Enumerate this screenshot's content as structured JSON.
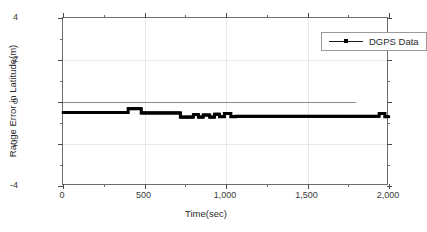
{
  "chart_data": {
    "type": "line",
    "title": "",
    "xlabel": "Time(sec)",
    "ylabel": "Range Error in Latitude(m)",
    "xlim": [
      0,
      2000
    ],
    "ylim": [
      -4,
      4
    ],
    "xticks": [
      0,
      500,
      1000,
      1500,
      2000
    ],
    "xtick_labels": [
      "0",
      "500",
      "1,000",
      "1,500",
      "2,000"
    ],
    "yticks": [
      4,
      2,
      0,
      -2,
      -4
    ],
    "ytick_labels": [
      "4",
      "2",
      "0",
      "-2",
      "-4"
    ],
    "x_minor_interval": 250,
    "y_minor_interval": 1,
    "grid": true,
    "grid_color": "#e8e8e8",
    "zero_line": {
      "y": 0,
      "x_start": 0,
      "x_end": 1800,
      "color": "#8a8a8a"
    },
    "legend": {
      "position": "top-right",
      "entries": [
        {
          "label": "DGPS Data",
          "color": "#000000",
          "marker": "square",
          "line": "solid"
        }
      ]
    },
    "series": [
      {
        "name": "DGPS Data",
        "color": "#000000",
        "line_width": 3,
        "marker": "square",
        "x": [
          0,
          400,
          400,
          480,
          480,
          720,
          720,
          800,
          800,
          830,
          830,
          860,
          860,
          900,
          900,
          930,
          930,
          960,
          960,
          990,
          990,
          1030,
          1030,
          1060,
          1060,
          1940,
          1940,
          1975,
          1975,
          2000
        ],
        "y": [
          -0.5,
          -0.5,
          -0.32,
          -0.32,
          -0.52,
          -0.52,
          -0.72,
          -0.72,
          -0.6,
          -0.6,
          -0.72,
          -0.72,
          -0.62,
          -0.62,
          -0.72,
          -0.72,
          -0.58,
          -0.58,
          -0.7,
          -0.7,
          -0.55,
          -0.55,
          -0.7,
          -0.7,
          -0.68,
          -0.68,
          -0.55,
          -0.55,
          -0.7,
          -0.7
        ]
      }
    ]
  },
  "axes": {
    "y_title": "Range Error in Latitude(m)",
    "x_title": "Time(sec)"
  },
  "legend_box": {
    "label": "DGPS Data"
  }
}
